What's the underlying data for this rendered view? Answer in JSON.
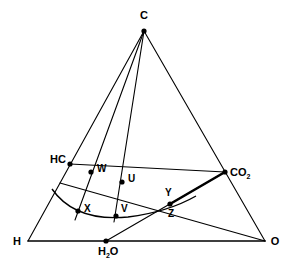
{
  "diagram": {
    "type": "ternary-composition-diagram",
    "title": "",
    "vertices": [
      {
        "id": "C",
        "label": "C",
        "x": 144,
        "y": 31,
        "lx": 144,
        "ly": 19,
        "anchor": "middle",
        "dot": true
      },
      {
        "id": "H",
        "label": "H",
        "x": 28,
        "y": 241,
        "lx": 17,
        "ly": 245,
        "anchor": "middle",
        "dot": false
      },
      {
        "id": "O",
        "label": "O",
        "x": 265,
        "y": 241,
        "lx": 275,
        "ly": 245,
        "anchor": "middle",
        "dot": false
      }
    ],
    "species": [
      {
        "id": "HC",
        "label": "HC",
        "x": 70,
        "y": 164,
        "lx": 66,
        "ly": 163,
        "anchor": "end",
        "dot": true
      },
      {
        "id": "CO2",
        "label": "CO",
        "sub": "2",
        "x": 225,
        "y": 172,
        "lx": 230,
        "ly": 176,
        "anchor": "start",
        "dot": true
      },
      {
        "id": "H2O",
        "label": "H",
        "sub": "2",
        "tail": "O",
        "x": 106,
        "y": 241,
        "lx": 98,
        "ly": 255,
        "anchor": "start",
        "dot": true
      }
    ],
    "points": [
      {
        "id": "W",
        "label": "W",
        "x": 91,
        "y": 172,
        "lx": 97,
        "ly": 172,
        "anchor": "start",
        "dot": true
      },
      {
        "id": "U",
        "label": "U",
        "x": 122,
        "y": 182,
        "lx": 128,
        "ly": 182,
        "anchor": "start",
        "dot": true
      },
      {
        "id": "X",
        "label": "X",
        "x": 78,
        "y": 211,
        "lx": 84,
        "ly": 212,
        "anchor": "start",
        "dot": true
      },
      {
        "id": "V",
        "label": "V",
        "x": 116,
        "y": 216,
        "lx": 121,
        "ly": 212,
        "anchor": "start",
        "dot": true
      },
      {
        "id": "Y",
        "label": "Y",
        "x": 170,
        "y": 204,
        "lx": 165,
        "ly": 196,
        "anchor": "start",
        "dot": true
      },
      {
        "id": "Z",
        "label": "Z",
        "x": 170,
        "y": 204,
        "lx": 168,
        "ly": 217,
        "anchor": "start",
        "dot": false
      }
    ],
    "edges": [
      {
        "id": "triangle-left",
        "from": "C",
        "to": "H",
        "x1": 144,
        "y1": 31,
        "x2": 28,
        "y2": 241,
        "w": 1.1
      },
      {
        "id": "triangle-right",
        "from": "C",
        "to": "O",
        "x1": 144,
        "y1": 31,
        "x2": 265,
        "y2": 241,
        "w": 1.1
      },
      {
        "id": "triangle-base",
        "from": "H",
        "to": "O",
        "x1": 28,
        "y1": 241,
        "x2": 265,
        "y2": 241,
        "w": 1.6
      },
      {
        "id": "C-to-X",
        "from": "C",
        "to": "X",
        "x1": 144,
        "y1": 31,
        "x2": 75,
        "y2": 220,
        "w": 1.1
      },
      {
        "id": "C-to-V",
        "from": "C",
        "to": "V",
        "x1": 144,
        "y1": 31,
        "x2": 114,
        "y2": 222,
        "w": 1.1
      },
      {
        "id": "HC-to-CO2",
        "from": "HC",
        "to": "CO2",
        "x1": 70,
        "y1": 164,
        "x2": 225,
        "y2": 172,
        "w": 1.1
      },
      {
        "id": "H2O-to-CO2",
        "from": "H2O",
        "to": "CO2",
        "x1": 106,
        "y1": 241,
        "x2": 225,
        "y2": 172,
        "w": 1.1
      },
      {
        "id": "O-to-HCline",
        "from": "O",
        "to": "HC",
        "x1": 265,
        "y1": 241,
        "x2": 60,
        "y2": 183,
        "w": 1.1
      },
      {
        "id": "YZ-to-CO2-bold",
        "from": "Y",
        "to": "CO2",
        "x1": 170,
        "y1": 204,
        "x2": 225,
        "y2": 172,
        "w": 2.6
      }
    ],
    "curve": {
      "id": "iso-arc",
      "label": "arc through X and V",
      "path": "M 52,189 Q 75,222 128,217 Q 168,212 196,196"
    }
  }
}
